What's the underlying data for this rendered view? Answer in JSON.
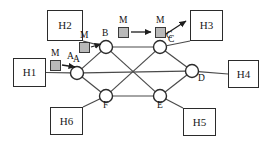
{
  "diagram": {
    "canvas": {
      "width": 267,
      "height": 145
    },
    "colors": {
      "line": "#4a4a4a",
      "node_stroke": "#2b2b2b",
      "node_fill": "#ffffff",
      "box_stroke": "#2b2b2b",
      "packet_fill": "#b9b9b9",
      "packet_stroke": "#3a3a3a",
      "text": "#111111",
      "background": "#ffffff"
    },
    "hosts": [
      {
        "id": "H1",
        "label": "H1",
        "x": 13,
        "y": 58,
        "w": 33,
        "h": 29
      },
      {
        "id": "H2",
        "label": "H2",
        "x": 47,
        "y": 10,
        "w": 36,
        "h": 31
      },
      {
        "id": "H3",
        "label": "H3",
        "x": 190,
        "y": 10,
        "w": 33,
        "h": 31
      },
      {
        "id": "H4",
        "label": "H4",
        "x": 228,
        "y": 60,
        "w": 31,
        "h": 28
      },
      {
        "id": "H5",
        "label": "H5",
        "x": 183,
        "y": 108,
        "w": 33,
        "h": 28
      },
      {
        "id": "H6",
        "label": "H6",
        "x": 50,
        "y": 107,
        "w": 33,
        "h": 28
      }
    ],
    "routers": [
      {
        "id": "A",
        "label": "A",
        "cx": 77,
        "cy": 73,
        "r": 6.5,
        "label_dx": -4,
        "label_dy": -18
      },
      {
        "id": "B",
        "label": "B",
        "cx": 106,
        "cy": 47,
        "r": 6.5,
        "label_dx": -4,
        "label_dy": -18
      },
      {
        "id": "C",
        "label": "C",
        "cx": 160,
        "cy": 47,
        "r": 6.5,
        "label_dx": 6,
        "label_dy": -16
      },
      {
        "id": "D",
        "label": "D",
        "cx": 192,
        "cy": 71,
        "r": 6.5,
        "label_dx": 6,
        "label_dy": 3
      },
      {
        "id": "E",
        "label": "E",
        "cx": 160,
        "cy": 96,
        "r": 6.5,
        "label_dx": -3,
        "label_dy": 5
      },
      {
        "id": "F",
        "label": "F",
        "cx": 106,
        "cy": 96,
        "r": 6.5,
        "label_dx": -3,
        "label_dy": 5
      }
    ],
    "links": [
      {
        "from": "A",
        "to": "B"
      },
      {
        "from": "B",
        "to": "C"
      },
      {
        "from": "C",
        "to": "D"
      },
      {
        "from": "D",
        "to": "E"
      },
      {
        "from": "E",
        "to": "F"
      },
      {
        "from": "F",
        "to": "A"
      },
      {
        "from": "A",
        "to": "D"
      },
      {
        "from": "B",
        "to": "E"
      },
      {
        "from": "C",
        "to": "F"
      }
    ],
    "host_links": [
      {
        "host": "H1",
        "router": "A"
      },
      {
        "host": "H2",
        "router": "B"
      },
      {
        "host": "H3",
        "router": "C"
      },
      {
        "host": "H4",
        "router": "D"
      },
      {
        "host": "H5",
        "router": "E"
      },
      {
        "host": "H6",
        "router": "F"
      }
    ],
    "packets": [
      {
        "id": "pkt-h1-a",
        "label": "M",
        "x": 50,
        "y": 60,
        "label_x": 51,
        "label_y": 49
      },
      {
        "id": "pkt-a-b",
        "label": "M",
        "x": 79,
        "y": 42,
        "label_x": 80,
        "label_y": 31
      },
      {
        "id": "pkt-b-c",
        "label": "M",
        "x": 118,
        "y": 27,
        "label_x": 119,
        "label_y": 16
      },
      {
        "id": "pkt-c-h3",
        "label": "M",
        "x": 155,
        "y": 27,
        "label_x": 156,
        "label_y": 16
      }
    ],
    "flow_arrows": [
      {
        "id": "arrow-h1-to-a",
        "x1": 62,
        "y1": 65,
        "x2": 75,
        "y2": 67
      },
      {
        "id": "arrow-a-to-b",
        "x1": 91,
        "y1": 47,
        "x2": 101,
        "y2": 44
      },
      {
        "id": "arrow-b-to-c",
        "x1": 131,
        "y1": 32,
        "x2": 151,
        "y2": 32
      },
      {
        "id": "arrow-c-to-h3",
        "x1": 166,
        "y1": 34,
        "x2": 186,
        "y2": 21
      }
    ],
    "link_labels": [
      {
        "id": "label-link-a",
        "text": "A",
        "x": 67,
        "y": 52
      },
      {
        "id": "label-link-c",
        "text": "C",
        "x": 168,
        "y": 35
      }
    ]
  }
}
